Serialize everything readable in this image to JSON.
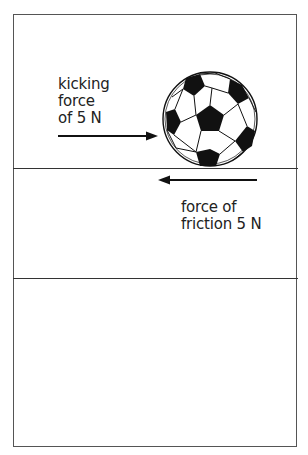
{
  "diagram": {
    "kicking_label": [
      "kicking",
      "force",
      "of 5 N"
    ],
    "friction_label": [
      "force of",
      "friction 5 N"
    ],
    "kicking_force": {
      "value": 5,
      "unit": "N",
      "direction": "right"
    },
    "friction_force": {
      "value": 5,
      "unit": "N",
      "direction": "left"
    },
    "object": "soccer-ball",
    "panels": 3
  }
}
